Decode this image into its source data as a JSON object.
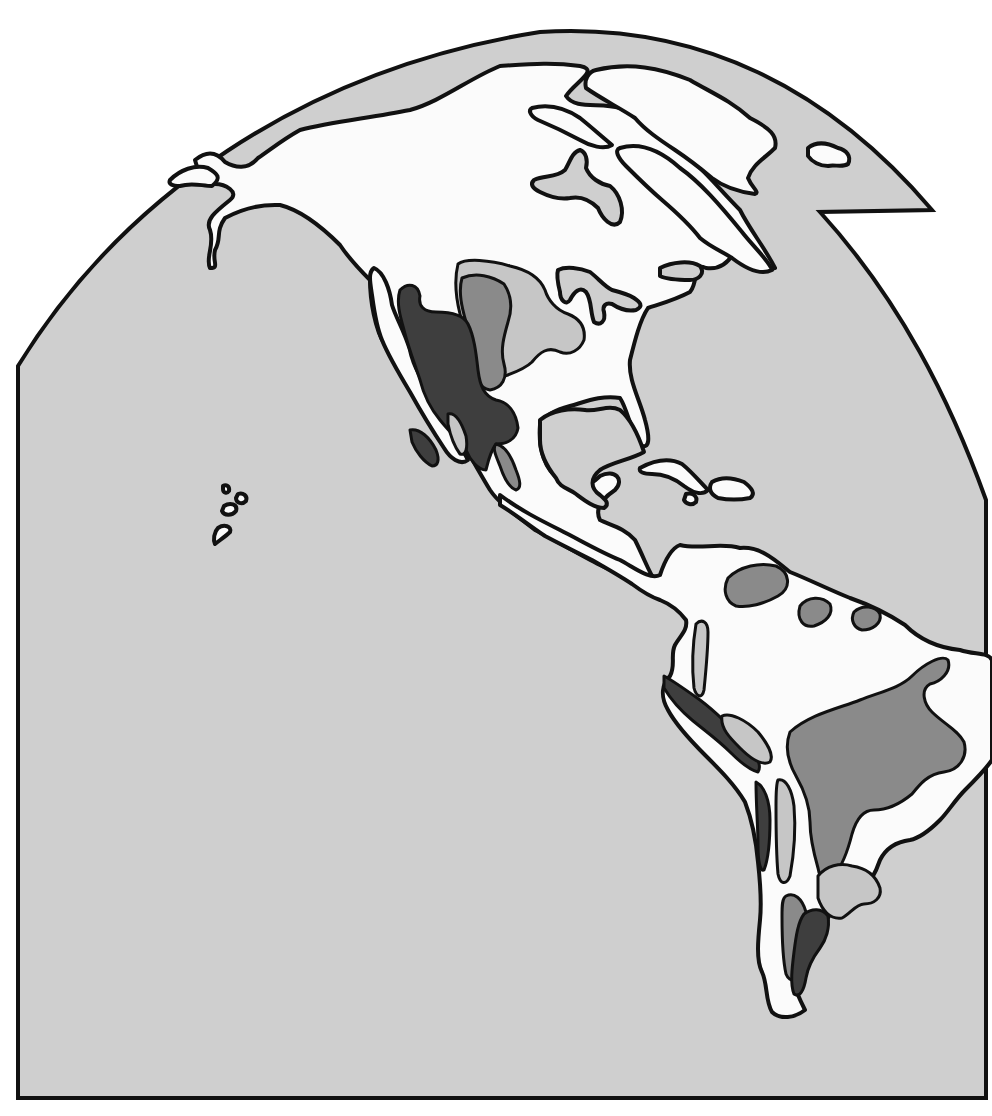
{
  "map": {
    "title": "",
    "projection": "globe-cutaway",
    "region": "Americas",
    "labels": [],
    "legend": [],
    "colors": {
      "page_background": "#ffffff",
      "ocean": "#cfcfcf",
      "land_base": "#fbfbfb",
      "outline": "#111111",
      "zone_light": "#c6c6c6",
      "zone_medium": "#8a8a8a",
      "zone_dark": "#3e3e3e"
    },
    "zones": [
      {
        "id": "great-plains",
        "shade": "zone_light"
      },
      {
        "id": "north-american-shortgrass",
        "shade": "zone_medium"
      },
      {
        "id": "north-american-desert",
        "shade": "zone_dark"
      },
      {
        "id": "llanos",
        "shade": "zone_medium"
      },
      {
        "id": "guiana-savanna",
        "shade": "zone_medium"
      },
      {
        "id": "cerrado-caatinga",
        "shade": "zone_medium"
      },
      {
        "id": "andean-puna",
        "shade": "zone_light"
      },
      {
        "id": "atacama-desert",
        "shade": "zone_dark"
      },
      {
        "id": "pampas",
        "shade": "zone_light"
      },
      {
        "id": "monte",
        "shade": "zone_medium"
      },
      {
        "id": "patagonian-desert",
        "shade": "zone_dark"
      }
    ]
  }
}
